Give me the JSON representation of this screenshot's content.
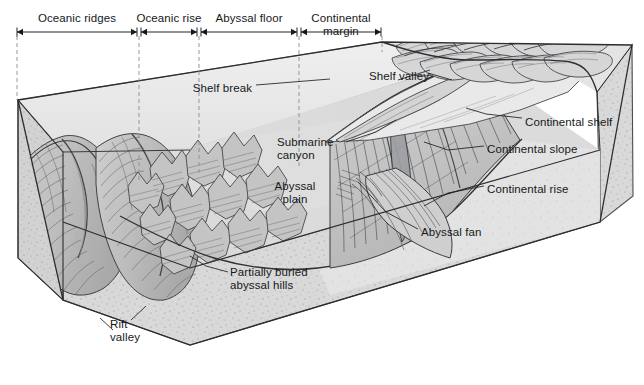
{
  "figure": {
    "caption_absent": true,
    "zone_scale": {
      "name": "ocean-basin-zone-scale",
      "zones": [
        {
          "id": "oceanic-ridges",
          "label": "Oceanic ridges",
          "x_start": 17,
          "x_end": 137,
          "label_x": 77,
          "label_y": 12
        },
        {
          "id": "oceanic-rise",
          "label": "Oceanic rise",
          "x_start": 141,
          "x_end": 197,
          "label_x": 169,
          "label_y": 12
        },
        {
          "id": "abyssal-floor",
          "label": "Abyssal floor",
          "x_start": 201,
          "x_end": 297,
          "label_x": 249,
          "label_y": 12
        },
        {
          "id": "continental-margin",
          "label": "Continental\nmargin",
          "x_start": 301,
          "x_end": 381,
          "label_x": 341,
          "label_y": 12
        }
      ],
      "tick_x": [
        17,
        139,
        199,
        299,
        382
      ],
      "axis_y": 32
    },
    "labels": [
      {
        "id": "shelf-break",
        "text": "Shelf break",
        "x": 252,
        "y": 82,
        "align": "rgt"
      },
      {
        "id": "shelf-valley",
        "text": "Shelf valley",
        "x": 369,
        "y": 70,
        "align": "lft"
      },
      {
        "id": "continental-shelf",
        "text": "Continental shelf",
        "x": 525,
        "y": 116,
        "align": "lft"
      },
      {
        "id": "continental-slope",
        "text": "Continental slope",
        "x": 487,
        "y": 143,
        "align": "lft"
      },
      {
        "id": "continental-rise",
        "text": "Continental rise",
        "x": 487,
        "y": 183,
        "align": "lft"
      },
      {
        "id": "submarine-canyon",
        "text": "Submarine\ncanyon",
        "x": 277,
        "y": 136,
        "align": "lft"
      },
      {
        "id": "abyssal-plain",
        "text": "Abyssal\nplain",
        "x": 295,
        "y": 180,
        "align": "ctr"
      },
      {
        "id": "abyssal-fan",
        "text": "Abyssal fan",
        "x": 421,
        "y": 226,
        "align": "lft"
      },
      {
        "id": "partially-buried-hills",
        "text": "Partially buried\nabyssal hills",
        "x": 230,
        "y": 266,
        "align": "lft"
      },
      {
        "id": "rift-valley",
        "text": "Rift\nvalley",
        "x": 110,
        "y": 318,
        "align": "lft"
      }
    ],
    "colors": {
      "ink": "#16181a",
      "line": "#3a3d40",
      "water_surface": "#ebebeb",
      "block_front": "#d7d7d7",
      "block_side": "#cdcdcd",
      "sea_floor": "#dcdcdc",
      "ridge_shade": "#b9b9b9",
      "land_top": "#e2e2e2",
      "dashed": "#8d8d8d",
      "shelf": "#e8e8e8",
      "slope": "#c8c8c8"
    }
  }
}
